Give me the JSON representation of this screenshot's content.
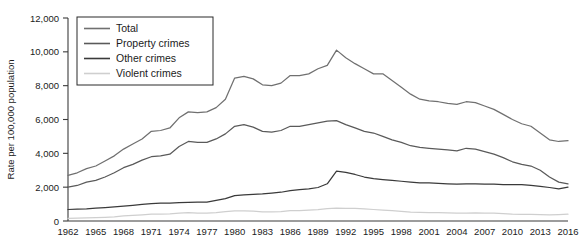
{
  "chart_data": {
    "type": "line",
    "title": "",
    "xlabel": "",
    "ylabel": "Rate per 100,000 population",
    "xlim": [
      1962,
      2016
    ],
    "ylim": [
      0,
      12000
    ],
    "grid": false,
    "legend_position": "top-left",
    "ytick_labels": [
      "0",
      "2,000",
      "4,000",
      "6,000",
      "8,000",
      "10,000",
      "12,000"
    ],
    "ytick_values": [
      0,
      2000,
      4000,
      6000,
      8000,
      10000,
      12000
    ],
    "xtick_labels": [
      "1962",
      "1965",
      "1968",
      "1971",
      "1974",
      "1977",
      "1980",
      "1983",
      "1986",
      "1989",
      "1992",
      "1995",
      "1998",
      "2001",
      "2004",
      "2007",
      "2010",
      "2013",
      "2016"
    ],
    "xtick_values": [
      1962,
      1965,
      1968,
      1971,
      1974,
      1977,
      1980,
      1983,
      1986,
      1989,
      1992,
      1995,
      1998,
      2001,
      2004,
      2007,
      2010,
      2013,
      2016
    ],
    "x": [
      1962,
      1963,
      1964,
      1965,
      1966,
      1967,
      1968,
      1969,
      1970,
      1971,
      1972,
      1973,
      1974,
      1975,
      1976,
      1977,
      1978,
      1979,
      1980,
      1981,
      1982,
      1983,
      1984,
      1985,
      1986,
      1987,
      1988,
      1989,
      1990,
      1991,
      1992,
      1993,
      1994,
      1995,
      1996,
      1997,
      1998,
      1999,
      2000,
      2001,
      2002,
      2003,
      2004,
      2005,
      2006,
      2007,
      2008,
      2009,
      2010,
      2011,
      2012,
      2013,
      2014,
      2015,
      2016
    ],
    "series": [
      {
        "name": "Total",
        "color": "#707070",
        "values": [
          2700,
          2850,
          3100,
          3250,
          3550,
          3850,
          4250,
          4550,
          4850,
          5300,
          5350,
          5500,
          6100,
          6450,
          6400,
          6450,
          6700,
          7200,
          8450,
          8550,
          8400,
          8050,
          8000,
          8150,
          8600,
          8600,
          8700,
          9000,
          9200,
          10100,
          9650,
          9300,
          9000,
          8700,
          8700,
          8300,
          7900,
          7500,
          7200,
          7100,
          7050,
          6950,
          6900,
          7050,
          7000,
          6800,
          6600,
          6300,
          6000,
          5750,
          5600,
          5200,
          4800,
          4700,
          4750
        ]
      },
      {
        "name": "Property crimes",
        "color": "#5a5a5a",
        "values": [
          2000,
          2100,
          2300,
          2400,
          2600,
          2850,
          3150,
          3350,
          3600,
          3800,
          3850,
          3950,
          4400,
          4700,
          4650,
          4650,
          4850,
          5150,
          5600,
          5700,
          5550,
          5300,
          5250,
          5350,
          5600,
          5600,
          5700,
          5800,
          5900,
          5930,
          5700,
          5500,
          5300,
          5200,
          5000,
          4800,
          4650,
          4450,
          4350,
          4300,
          4250,
          4200,
          4150,
          4300,
          4250,
          4100,
          3950,
          3750,
          3500,
          3350,
          3250,
          3000,
          2600,
          2300,
          2200
        ]
      },
      {
        "name": "Other crimes",
        "color": "#3a3a3a",
        "values": [
          680,
          700,
          720,
          760,
          790,
          830,
          880,
          930,
          980,
          1030,
          1050,
          1060,
          1080,
          1100,
          1110,
          1120,
          1220,
          1320,
          1500,
          1550,
          1580,
          1600,
          1650,
          1700,
          1800,
          1850,
          1900,
          1980,
          2200,
          2950,
          2880,
          2750,
          2600,
          2500,
          2450,
          2400,
          2350,
          2300,
          2250,
          2250,
          2230,
          2200,
          2180,
          2200,
          2200,
          2180,
          2180,
          2150,
          2150,
          2150,
          2100,
          2050,
          1980,
          1900,
          2000
        ]
      },
      {
        "name": "Violent crimes",
        "color": "#cfcfcf",
        "values": [
          160,
          170,
          190,
          200,
          220,
          250,
          300,
          330,
          360,
          400,
          400,
          420,
          460,
          490,
          470,
          470,
          500,
          550,
          600,
          600,
          580,
          540,
          540,
          560,
          620,
          610,
          640,
          670,
          730,
          760,
          750,
          750,
          710,
          680,
          640,
          610,
          570,
          520,
          510,
          500,
          490,
          480,
          470,
          470,
          480,
          470,
          460,
          430,
          400,
          390,
          390,
          370,
          360,
          380,
          400
        ]
      }
    ]
  }
}
